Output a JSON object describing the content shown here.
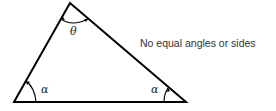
{
  "diagram": {
    "type": "scalene-triangle",
    "caption": "No equal angles or sides",
    "angles": {
      "top": "θ",
      "bottom_left": "α",
      "bottom_right": "α"
    },
    "colors": {
      "stroke": "#000000",
      "text": "#333333"
    }
  }
}
